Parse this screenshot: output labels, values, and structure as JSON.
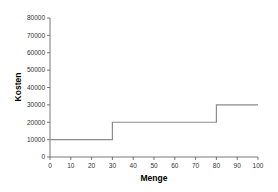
{
  "chart_data": {
    "type": "line",
    "subtype": "step",
    "title": "",
    "xlabel": "Menge",
    "ylabel": "Kosten",
    "xlim": [
      0,
      100
    ],
    "ylim": [
      0,
      80000
    ],
    "x_ticks": [
      0,
      10,
      20,
      30,
      40,
      50,
      60,
      70,
      80,
      90,
      100
    ],
    "y_ticks": [
      0,
      10000,
      20000,
      30000,
      40000,
      50000,
      60000,
      70000,
      80000
    ],
    "grid": false,
    "legend": null,
    "series": [
      {
        "name": "Kosten",
        "color": "#8c8c8c",
        "points": [
          {
            "x": 0,
            "y": 10000
          },
          {
            "x": 30,
            "y": 10000
          },
          {
            "x": 30,
            "y": 20000
          },
          {
            "x": 80,
            "y": 20000
          },
          {
            "x": 80,
            "y": 30000
          },
          {
            "x": 100,
            "y": 30000
          }
        ]
      }
    ]
  },
  "colors": {
    "axis": "#555555",
    "line": "#8c8c8c"
  }
}
